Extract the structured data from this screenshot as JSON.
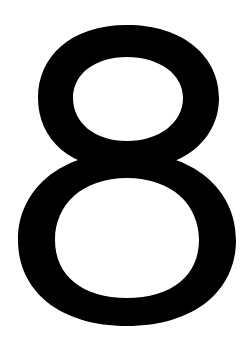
{
  "glyph": {
    "character": "8",
    "color": "#000000",
    "background": "#ffffff"
  }
}
